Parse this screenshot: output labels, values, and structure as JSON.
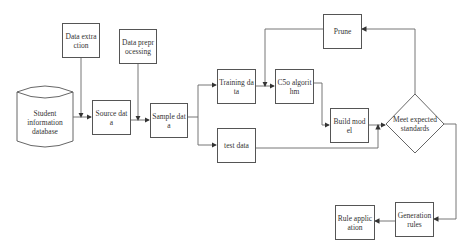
{
  "diagram": {
    "nodes": {
      "data_extraction": "Data extraction",
      "data_preprocessing": "Data preprocessing",
      "student_db": "Student information database",
      "source_data": "Source data",
      "sample_data": "Sample data",
      "training_data": "Training data",
      "test_data": "test data",
      "c5o_algorithm": "C5o algorithm",
      "prune": "Prune",
      "build_model": "Build model",
      "meet_standards": "Meet expected standards",
      "generation_rules": "Generation rules",
      "rule_application": "Rule application"
    },
    "edges": [
      [
        "data_extraction",
        "source_data"
      ],
      [
        "student_db",
        "source_data"
      ],
      [
        "data_preprocessing",
        "sample_data"
      ],
      [
        "source_data",
        "sample_data"
      ],
      [
        "sample_data",
        "training_data"
      ],
      [
        "sample_data",
        "test_data"
      ],
      [
        "training_data",
        "c5o_algorithm"
      ],
      [
        "prune",
        "c5o_algorithm"
      ],
      [
        "c5o_algorithm",
        "build_model"
      ],
      [
        "build_model",
        "meet_standards"
      ],
      [
        "test_data",
        "meet_standards"
      ],
      [
        "meet_standards",
        "prune"
      ],
      [
        "meet_standards",
        "generation_rules"
      ],
      [
        "generation_rules",
        "rule_application"
      ]
    ]
  }
}
